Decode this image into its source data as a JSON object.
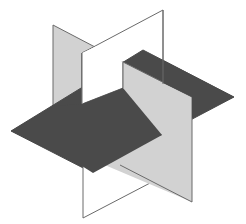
{
  "diagram": {
    "title": "",
    "colors": {
      "background": "#ffffff",
      "dark_plane": "#4a4a4a",
      "grey_plane": "#d2d2d2",
      "white_plane": "#ffffff",
      "edge": "#6a6a6a"
    },
    "planes": [
      {
        "name": "horizontal-plane",
        "shade": "dark"
      },
      {
        "name": "vertical-plane-grey",
        "shade": "light-grey"
      },
      {
        "name": "vertical-plane-white",
        "shade": "white"
      }
    ]
  }
}
